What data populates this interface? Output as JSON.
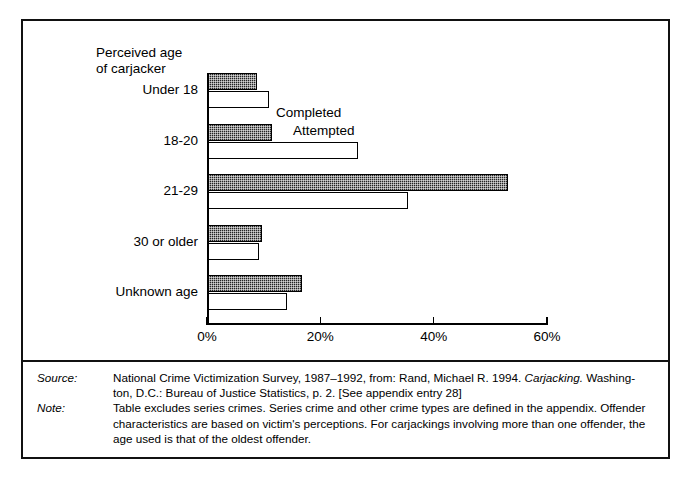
{
  "chart_data": {
    "type": "bar",
    "orientation": "horizontal",
    "title": "Perceived age\nof carjacker",
    "axis_title": "Perceived age of carjacker",
    "categories": [
      "Under 18",
      "18-20",
      "21-29",
      "30 or older",
      "Unknown age"
    ],
    "series": [
      {
        "name": "Completed",
        "values": [
          8.6,
          11.3,
          53.0,
          9.6,
          16.5
        ]
      },
      {
        "name": "Attempted",
        "values": [
          10.8,
          26.5,
          35.3,
          9.0,
          14.0
        ]
      }
    ],
    "xlabel": "",
    "ylabel": "",
    "xlim": [
      0,
      60
    ],
    "xticks": [
      0,
      20,
      40,
      60
    ],
    "xtick_labels": [
      "0%",
      "20%",
      "40%",
      "60%"
    ],
    "grid": false,
    "legend_position": "inside-top-left",
    "colors": {
      "completed": "#242424",
      "attempted": "#ffffff",
      "axis": "#000000",
      "frame": "#111111"
    }
  },
  "notes": [
    {
      "tag": "Source:",
      "text": "National Crime Victimization Survey, 1987–1992, from: Rand, Michael R. 1994. Carjacking. Washington, D.C.: Bureau of Justice Statistics, p. 2. [See appendix entry 28]",
      "line1_a": "National Crime Victimization Survey, 1987–1992, from: Rand, Michael R. 1994. ",
      "line1_italic": "Carjacking.",
      "line1_b": " Washing-",
      "line2": "ton, D.C.: Bureau of Justice Statistics, p. 2. [See appendix entry 28]"
    },
    {
      "tag": "Note:",
      "text": "Table excludes series crimes. Series crime and other crime types are defined in the appendix. Offender characteristics are based on victim's perceptions. For carjackings involving more than one offender, the age used is that of the oldest offender.",
      "line1": "Table excludes series crimes. Series crime and other crime types are defined in the appendix.",
      "line2": "Offender characteristics are based on victim's perceptions. For carjackings involving more than one",
      "line3": "offender, the age used is that of the oldest offender."
    }
  ]
}
